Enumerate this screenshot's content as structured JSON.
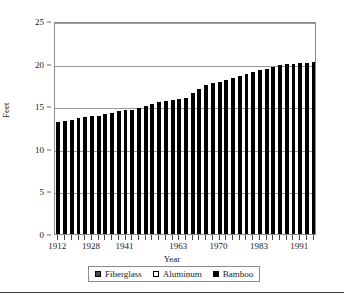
{
  "chart_data": {
    "type": "bar",
    "title": "",
    "xlabel": "Year",
    "ylabel": "Feet",
    "ylim": [
      0,
      25
    ],
    "yticks": [
      0,
      5,
      10,
      15,
      20,
      25
    ],
    "ytick_labels": [
      "0",
      "5",
      "10",
      "15",
      "20",
      "25"
    ],
    "grid": true,
    "grid_axis": "y",
    "legend_position": "below-axes",
    "bar_color": "#000000",
    "x": [
      1912,
      1913,
      1920,
      1924,
      1927,
      1928,
      1932,
      1936,
      1937,
      1940,
      1941,
      1942,
      1950,
      1951,
      1957,
      1960,
      1961,
      1962,
      1963,
      1964,
      1966,
      1967,
      1968,
      1969,
      1970,
      1972,
      1975,
      1976,
      1980,
      1981,
      1983,
      1984,
      1985,
      1986,
      1987,
      1988,
      1991,
      1992,
      1993
    ],
    "xtick_labels": [
      "1912",
      "1928",
      "1941",
      "1963",
      "1970",
      "1983",
      "1991"
    ],
    "xtick_positions": [
      1912,
      1928,
      1941,
      1963,
      1970,
      1983,
      1991
    ],
    "categories": [
      "1912",
      "1913",
      "1920",
      "1924",
      "1927",
      "1928",
      "1932",
      "1936",
      "1937",
      "1940",
      "1941",
      "1942",
      "1950",
      "1951",
      "1957",
      "1960",
      "1961",
      "1962",
      "1963",
      "1964",
      "1966",
      "1967",
      "1968",
      "1969",
      "1970",
      "1972",
      "1975",
      "1976",
      "1980",
      "1981",
      "1983",
      "1984",
      "1985",
      "1986",
      "1987",
      "1988",
      "1991",
      "1992",
      "1993"
    ],
    "values": [
      13.2,
      13.3,
      13.4,
      13.6,
      13.7,
      13.8,
      13.9,
      14.1,
      14.2,
      14.4,
      14.5,
      14.6,
      14.8,
      15.0,
      15.3,
      15.5,
      15.6,
      15.7,
      15.8,
      16.0,
      16.5,
      17.0,
      17.5,
      17.7,
      17.9,
      18.1,
      18.3,
      18.5,
      18.8,
      19.0,
      19.2,
      19.4,
      19.6,
      19.8,
      19.9,
      20.0,
      20.1,
      20.1,
      20.2
    ],
    "series": [
      {
        "name": "Fiberglass",
        "swatch_color": "#4a4a4a",
        "swatch_border": "#000000"
      },
      {
        "name": "Aluminum",
        "swatch_color": "#ffffff",
        "swatch_border": "#000000"
      },
      {
        "name": "Bamboo",
        "swatch_color": "#000000",
        "swatch_border": "#000000"
      }
    ]
  },
  "axes": {
    "y_title": "Feet",
    "x_title": "Year"
  },
  "legend": {
    "entries": [
      {
        "label": "Fiberglass"
      },
      {
        "label": "Aluminum"
      },
      {
        "label": "Bamboo"
      }
    ]
  }
}
